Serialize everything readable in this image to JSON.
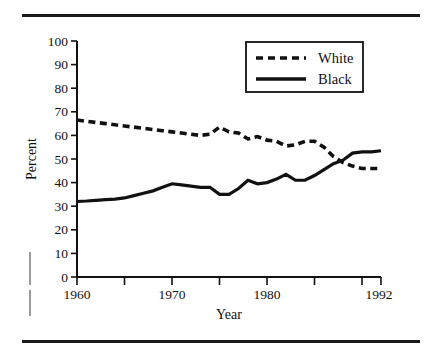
{
  "figure": {
    "rule_top_label": "top-rule",
    "rule_bottom_label": "bottom-rule"
  },
  "chart_data": {
    "type": "line",
    "title": "",
    "xlabel": "Year",
    "ylabel": "Percent",
    "xlim": [
      1960,
      1992
    ],
    "ylim": [
      0,
      100
    ],
    "grid": false,
    "legend_position": "top-right",
    "x_tick_values": [
      1960,
      1965,
      1970,
      1975,
      1980,
      1985,
      1990,
      1992
    ],
    "x_tick_labels": [
      "1960",
      "",
      "1970",
      "",
      "1980",
      "",
      "",
      "1992"
    ],
    "x_labeled_ticks": [
      "1960",
      "1970",
      "1980",
      "1992"
    ],
    "y_tick_values": [
      0,
      10,
      20,
      30,
      40,
      50,
      60,
      70,
      80,
      90,
      100
    ],
    "y_tick_labels": [
      "0",
      "10",
      "20",
      "30",
      "40",
      "50",
      "60",
      "70",
      "80",
      "90",
      "100"
    ],
    "x": [
      1960,
      1961,
      1962,
      1963,
      1964,
      1965,
      1966,
      1967,
      1968,
      1969,
      1970,
      1971,
      1972,
      1973,
      1974,
      1975,
      1976,
      1977,
      1978,
      1979,
      1980,
      1981,
      1982,
      1983,
      1984,
      1985,
      1986,
      1987,
      1988,
      1989,
      1990,
      1991,
      1992
    ],
    "series": [
      {
        "name": "White",
        "style": "dashed",
        "color": "#111111",
        "values": [
          66.5,
          66.0,
          65.5,
          65.0,
          64.5,
          64.0,
          63.5,
          63.0,
          62.5,
          62.0,
          61.5,
          61.0,
          60.5,
          60.0,
          60.5,
          63.5,
          61.5,
          61.0,
          58.5,
          59.5,
          58.0,
          57.5,
          55.5,
          56.0,
          57.5,
          57.5,
          55.0,
          51.0,
          48.5,
          47.0,
          46.0,
          46.0,
          46.0
        ]
      },
      {
        "name": "Black",
        "style": "solid",
        "color": "#111111",
        "values": [
          32.0,
          32.2,
          32.5,
          32.8,
          33.0,
          33.5,
          34.5,
          35.5,
          36.5,
          38.0,
          39.5,
          39.0,
          38.5,
          38.0,
          38.0,
          35.0,
          35.0,
          37.5,
          41.0,
          39.5,
          40.0,
          41.5,
          43.5,
          41.0,
          41.0,
          43.0,
          45.5,
          48.0,
          49.5,
          52.5,
          53.0,
          53.0,
          53.5
        ]
      }
    ]
  },
  "legend": {
    "entries": [
      {
        "label": "White",
        "style": "dashed"
      },
      {
        "label": "Black",
        "style": "solid"
      }
    ]
  },
  "axes": {
    "y_title": "Percent",
    "x_title": "Year"
  }
}
